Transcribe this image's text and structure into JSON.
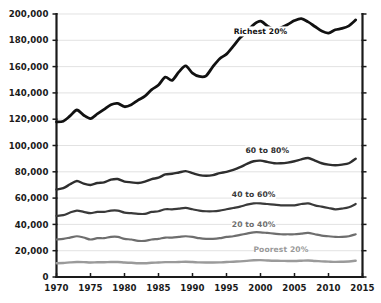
{
  "chart_data": {
    "type": "line",
    "title": "",
    "subtitle": "",
    "xlabel": "",
    "ylabel": "",
    "xlim": [
      1970,
      2015
    ],
    "ylim": [
      0,
      200000
    ],
    "grid": true,
    "grid_axis": "y",
    "legend_position": "inline-labels",
    "y_ticks": [
      0,
      20000,
      40000,
      60000,
      80000,
      100000,
      120000,
      140000,
      160000,
      180000,
      200000
    ],
    "y_tick_labels": [
      "0",
      "20,000",
      "40,000",
      "60,000",
      "80,000",
      "100,000",
      "120,000",
      "140,000",
      "160,000",
      "180,000",
      "200,000"
    ],
    "x_ticks": [
      1970,
      1975,
      1980,
      1985,
      1990,
      1995,
      2000,
      2005,
      2010,
      2015
    ],
    "x_tick_labels": [
      "1970",
      "1975",
      "1980",
      "1985",
      "1990",
      "1995",
      "2000",
      "2005",
      "2010",
      "2015"
    ],
    "x": [
      1970,
      1971,
      1972,
      1973,
      1974,
      1975,
      1976,
      1977,
      1978,
      1979,
      1980,
      1981,
      1982,
      1983,
      1984,
      1985,
      1986,
      1987,
      1988,
      1989,
      1990,
      1991,
      1992,
      1993,
      1994,
      1995,
      1996,
      1997,
      1998,
      1999,
      2000,
      2001,
      2002,
      2003,
      2004,
      2005,
      2006,
      2007,
      2008,
      2009,
      2010,
      2011,
      2012,
      2013,
      2014
    ],
    "series": [
      {
        "name": "Richest 20%",
        "label": "Richest 20%",
        "color": "#111111",
        "stroke_width": 2.8,
        "label_x": 2000,
        "label_y": 186000,
        "values": [
          118000,
          118500,
          122500,
          127000,
          123000,
          120500,
          124000,
          127500,
          131000,
          132000,
          129500,
          131000,
          134500,
          137500,
          142500,
          146000,
          152000,
          149500,
          156000,
          160500,
          155000,
          152500,
          153000,
          160000,
          166000,
          169500,
          175500,
          182000,
          186500,
          192000,
          194500,
          191000,
          188000,
          189500,
          192000,
          195000,
          196500,
          194000,
          190500,
          187000,
          185500,
          188000,
          189000,
          191000,
          195500
        ]
      },
      {
        "name": "60 to 80%",
        "label": "60 to 80%",
        "color": "#2e2e2e",
        "stroke_width": 2.4,
        "label_x": 2001,
        "label_y": 95500,
        "values": [
          66500,
          67500,
          70500,
          73000,
          71000,
          70000,
          71500,
          72000,
          74000,
          74500,
          72500,
          72000,
          71500,
          72500,
          74500,
          75500,
          78000,
          78500,
          79500,
          80500,
          79000,
          77500,
          77000,
          77500,
          79000,
          80000,
          81500,
          83500,
          86000,
          88000,
          88500,
          87500,
          86500,
          86500,
          87000,
          88000,
          89500,
          90500,
          88500,
          86500,
          85500,
          85000,
          85500,
          86500,
          90000
        ]
      },
      {
        "name": "40 to 60%",
        "label": "40 to 60%",
        "color": "#3a3a3a",
        "stroke_width": 2.2,
        "label_x": 1999,
        "label_y": 62000,
        "values": [
          46500,
          47000,
          49000,
          50500,
          49500,
          48500,
          49500,
          49500,
          50500,
          50500,
          49000,
          48500,
          48000,
          48000,
          49500,
          50000,
          51500,
          51500,
          52000,
          52500,
          51500,
          50500,
          50000,
          50000,
          50500,
          51500,
          52500,
          53500,
          55000,
          56000,
          56000,
          55500,
          55000,
          54500,
          54500,
          54500,
          55500,
          56000,
          54500,
          53500,
          52500,
          51500,
          52000,
          53000,
          55500
        ]
      },
      {
        "name": "20 to 40%",
        "label": "20 to 40%",
        "color": "#6e6e6e",
        "stroke_width": 2.2,
        "label_x": 1999,
        "label_y": 39500,
        "values": [
          28500,
          29000,
          30000,
          31000,
          30000,
          28500,
          29500,
          29500,
          30500,
          30500,
          29000,
          28500,
          27500,
          27500,
          28500,
          29000,
          30000,
          30000,
          30500,
          31000,
          30500,
          29500,
          29000,
          29000,
          29500,
          30500,
          31000,
          32000,
          33000,
          34000,
          34000,
          33500,
          33000,
          32500,
          32500,
          32500,
          33000,
          33500,
          32500,
          31500,
          31000,
          30500,
          30500,
          31000,
          32500
        ]
      },
      {
        "name": "Poorest 20%",
        "label": "Poorest 20%",
        "color": "#9a9a9a",
        "stroke_width": 2.4,
        "label_x": 2003,
        "label_y": 20500,
        "values": [
          10500,
          10700,
          11100,
          11400,
          11300,
          11000,
          11200,
          11200,
          11400,
          11400,
          11000,
          10800,
          10500,
          10500,
          10800,
          11000,
          11300,
          11300,
          11400,
          11600,
          11400,
          11100,
          11000,
          11000,
          11100,
          11400,
          11600,
          11900,
          12300,
          12700,
          12800,
          12600,
          12400,
          12300,
          12200,
          12200,
          12400,
          12600,
          12200,
          11900,
          11700,
          11500,
          11600,
          11800,
          12400
        ]
      }
    ]
  },
  "colors": {
    "axis": "#1a1a1a",
    "gridline": "#d6d6d6",
    "background": "#ffffff",
    "label_text": "#1a1a1a"
  }
}
